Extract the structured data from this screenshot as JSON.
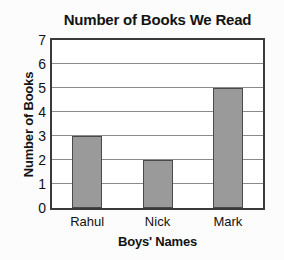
{
  "chart_data": {
    "type": "bar",
    "title": "Number of Books We Read",
    "xlabel": "Boys' Names",
    "ylabel": "Number of Books",
    "categories": [
      "Rahul",
      "Nick",
      "Mark"
    ],
    "values": [
      3,
      2,
      5
    ],
    "ylim": [
      0,
      7
    ],
    "ytick_labels": [
      "7",
      "6",
      "5",
      "4",
      "3",
      "2",
      "1",
      "0"
    ],
    "yticks": [
      7,
      6,
      5,
      4,
      3,
      2,
      1,
      0
    ],
    "grid": "horizontal",
    "legend": "none",
    "colors": {
      "bar_fill": "#9a9a9a",
      "bar_outline": "#4a4a4a",
      "gridline": "#8a8a8a",
      "frame": "#3a3a3a",
      "plot_background": "#ffffff",
      "page_background": "#fcfcfd",
      "text": "#131313"
    }
  }
}
